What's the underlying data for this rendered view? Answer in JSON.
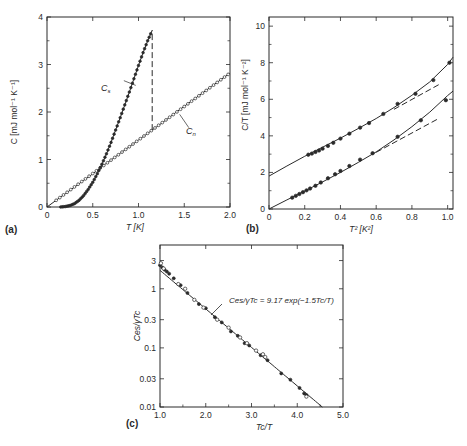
{
  "figure": {
    "background": "#ffffff",
    "ink": "#2a2a2a"
  },
  "chart_data": [
    {
      "panel": "(a)",
      "type": "line",
      "title": "",
      "xlabel": "T [K]",
      "ylabel": "C [mJ mol⁻¹ K⁻¹]",
      "xlim": [
        0,
        2.0
      ],
      "ylim": [
        0,
        4
      ],
      "xticks": [
        "0",
        "0.5",
        "1.0",
        "1.5",
        "2.0"
      ],
      "yticks": [
        "0",
        "1",
        "2",
        "3",
        "4"
      ],
      "grid": false,
      "annotations": [
        {
          "text": "Cs",
          "x": 0.92,
          "y": 2.6
        },
        {
          "text": "Cn",
          "x": 1.57,
          "y": 1.55
        }
      ],
      "series": [
        {
          "name": "Cn",
          "style": "open-circles-with-line",
          "x": [
            0,
            0.1,
            0.2,
            0.3,
            0.4,
            0.5,
            0.6,
            0.7,
            0.8,
            0.9,
            1.0,
            1.1,
            1.2,
            1.3,
            1.4,
            1.5,
            1.6,
            1.7,
            1.8,
            1.9,
            2.0
          ],
          "y": [
            0,
            0.14,
            0.28,
            0.42,
            0.56,
            0.7,
            0.85,
            0.99,
            1.13,
            1.27,
            1.41,
            1.55,
            1.69,
            1.83,
            1.98,
            2.12,
            2.26,
            2.4,
            2.54,
            2.68,
            2.82
          ]
        },
        {
          "name": "Cs",
          "style": "filled-circles-with-line",
          "x": [
            0.15,
            0.2,
            0.25,
            0.3,
            0.35,
            0.4,
            0.45,
            0.5,
            0.55,
            0.6,
            0.65,
            0.7,
            0.75,
            0.8,
            0.85,
            0.9,
            0.95,
            1.0,
            1.05,
            1.1,
            1.15
          ],
          "y": [
            0.0,
            0.01,
            0.03,
            0.07,
            0.14,
            0.24,
            0.37,
            0.52,
            0.7,
            0.9,
            1.12,
            1.36,
            1.62,
            1.88,
            2.15,
            2.42,
            2.7,
            2.98,
            3.25,
            3.5,
            3.72
          ]
        },
        {
          "name": "jump",
          "style": "dashed",
          "x": [
            1.15,
            1.15
          ],
          "y": [
            1.62,
            3.72
          ]
        }
      ]
    },
    {
      "panel": "(b)",
      "type": "line",
      "title": "",
      "xlabel": "T² [K²]",
      "ylabel": "C/T [mJ mol⁻¹ K⁻²]",
      "xlim": [
        0,
        1.03
      ],
      "ylim": [
        0,
        10.5
      ],
      "xticks": [
        "0",
        "0.2",
        "0.4",
        "0.6",
        "0.8",
        "1.0"
      ],
      "yticks": [
        "0",
        "2",
        "4",
        "6",
        "8",
        "10"
      ],
      "grid": false,
      "series": [
        {
          "name": "upper (normal state)",
          "style": "filled-circles-with-line",
          "x": [
            0.22,
            0.24,
            0.26,
            0.28,
            0.3,
            0.33,
            0.36,
            0.4,
            0.45,
            0.51,
            0.56,
            0.64,
            0.72,
            0.82,
            0.92,
            1.01
          ],
          "y": [
            2.97,
            3.03,
            3.12,
            3.2,
            3.3,
            3.45,
            3.62,
            3.85,
            4.12,
            4.45,
            4.7,
            5.2,
            5.75,
            6.3,
            7.05,
            8.0
          ]
        },
        {
          "name": "upper fit curve",
          "style": "solid",
          "x": [
            0,
            0.1,
            0.2,
            0.3,
            0.4,
            0.5,
            0.6,
            0.7,
            0.8,
            0.9,
            1.0,
            1.03
          ],
          "y": [
            1.8,
            2.35,
            2.88,
            3.38,
            3.88,
            4.4,
            4.95,
            5.55,
            6.22,
            6.95,
            7.9,
            8.3
          ]
        },
        {
          "name": "upper linear extrapolation",
          "style": "dashed",
          "x": [
            0.7,
            0.95
          ],
          "y": [
            5.45,
            6.8
          ]
        },
        {
          "name": "lower",
          "style": "filled-circles-with-line",
          "x": [
            0.13,
            0.15,
            0.17,
            0.19,
            0.21,
            0.23,
            0.26,
            0.29,
            0.33,
            0.37,
            0.4,
            0.45,
            0.51,
            0.58,
            0.72,
            0.85,
            0.99
          ],
          "y": [
            0.62,
            0.72,
            0.82,
            0.92,
            1.02,
            1.12,
            1.27,
            1.45,
            1.68,
            1.9,
            2.08,
            2.35,
            2.7,
            3.05,
            3.95,
            4.85,
            5.95
          ]
        },
        {
          "name": "lower fit curve",
          "style": "solid",
          "x": [
            0,
            0.1,
            0.2,
            0.3,
            0.4,
            0.5,
            0.6,
            0.7,
            0.8,
            0.9,
            1.0,
            1.03
          ],
          "y": [
            0,
            0.5,
            0.98,
            1.48,
            2.0,
            2.55,
            3.12,
            3.78,
            4.5,
            5.3,
            6.2,
            6.45
          ]
        },
        {
          "name": "lower linear extrapolation",
          "style": "dashed",
          "x": [
            0.6,
            0.95
          ],
          "y": [
            3.1,
            4.95
          ]
        }
      ]
    },
    {
      "panel": "(c)",
      "type": "scatter",
      "title": "",
      "xlabel": "Tc/T",
      "ylabel": "Ces/γTc",
      "xlim": [
        1.0,
        5.0
      ],
      "ylim": [
        0.01,
        5
      ],
      "yscale": "log",
      "xticks": [
        "1.0",
        "2.0",
        "3.0",
        "4.0",
        "5.0"
      ],
      "yticks": [
        "0.01",
        "0.03",
        "0.1",
        "0.3",
        "1",
        "3"
      ],
      "grid": false,
      "annotations": [
        {
          "text": "Ces/γTc = 9.17 exp(−1.5Tc/T)",
          "x": 2.55,
          "y": 0.8
        }
      ],
      "fit": {
        "a": 9.17,
        "b": 1.5,
        "x": [
          1.0,
          4.55
        ]
      },
      "series": [
        {
          "name": "filled",
          "style": "filled-circles",
          "x": [
            1.0,
            1.05,
            1.1,
            1.15,
            1.2,
            1.3,
            1.45,
            1.6,
            1.85,
            2.0,
            2.2,
            2.35,
            2.55,
            2.7,
            2.85,
            2.95,
            3.2,
            3.35,
            3.65,
            3.85,
            4.05,
            4.15,
            4.2
          ],
          "y": [
            2.5,
            2.3,
            2.1,
            1.95,
            1.8,
            1.5,
            1.15,
            0.85,
            0.55,
            0.47,
            0.33,
            0.27,
            0.19,
            0.16,
            0.12,
            0.11,
            0.075,
            0.062,
            0.037,
            0.029,
            0.021,
            0.017,
            0.016
          ]
        },
        {
          "name": "open",
          "style": "open-circles",
          "x": [
            1.02,
            1.08,
            1.4,
            1.55,
            1.75,
            1.95,
            2.25,
            2.5,
            2.75,
            2.9,
            3.1,
            3.25,
            3.3,
            4.2
          ],
          "y": [
            2.7,
            2.2,
            1.2,
            1.0,
            0.65,
            0.48,
            0.3,
            0.22,
            0.15,
            0.12,
            0.09,
            0.078,
            0.07,
            0.015
          ]
        }
      ]
    }
  ],
  "panels": {
    "a": {
      "label": "(a)",
      "xlabel": "T [K]",
      "ylabel": "C [mJ mol⁻¹ K⁻¹]",
      "curve_labels": {
        "cs": "Cs",
        "cn": "Cn"
      }
    },
    "b": {
      "label": "(b)",
      "xlabel": "T² [K²]",
      "ylabel": "C/T [mJ mol⁻¹ K⁻²]"
    },
    "c": {
      "label": "(c)",
      "xlabel": "Tc/T",
      "ylabel": "Ces/γTc",
      "equation": "Ces/γTc = 9.17 exp(−1.5Tc/T)"
    }
  }
}
